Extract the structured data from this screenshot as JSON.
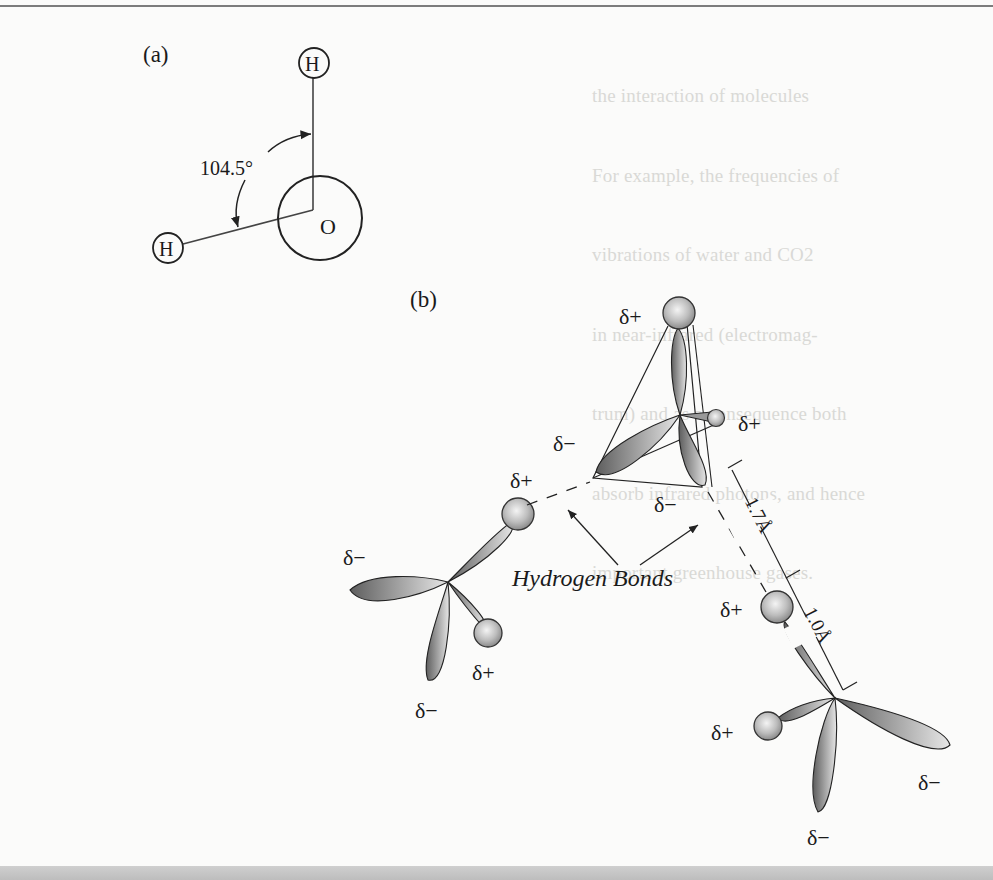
{
  "page": {
    "kind": "scanned textbook figure",
    "background": "#fbfbfa",
    "ink": "#1a1a1a"
  },
  "figure": {
    "panel_a": {
      "label": "(a)",
      "atoms": {
        "hydrogen_top": "H",
        "hydrogen_left": "H",
        "oxygen": "O"
      },
      "bond_angle": "104.5°"
    },
    "panel_b": {
      "label": "(b)",
      "charges": {
        "upper_top_h": "δ+",
        "upper_right_h": "δ+",
        "upper_left_lobe": "δ−",
        "upper_lower_lobe": "δ−",
        "left_upper_h": "δ+",
        "left_lobe": "δ−",
        "left_lower_h": "δ+",
        "left_bottom_lobe": "δ−",
        "lower_upper_h": "δ+",
        "lower_left_h": "δ+",
        "lower_right_lobe": "δ−",
        "lower_bottom_lobe": "δ−"
      },
      "hydrogen_bond_label": "Hydrogen Bonds",
      "distance_hbond": "1.7Å",
      "distance_covalent": "1.0Å"
    }
  },
  "show_through_text": [
    "the interaction of molecules",
    "For example, the frequencies of",
    "vibrations of water and CO2",
    "in near-infrared (electromag-",
    "trum) and as a consequence both",
    "absorb infrared photons, and hence",
    "important greenhouse gases."
  ]
}
